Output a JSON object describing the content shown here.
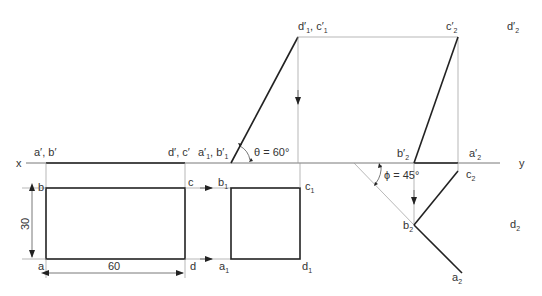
{
  "diagram": {
    "type": "orthographic-projection",
    "reference_line": {
      "left_label": "x",
      "right_label": "y"
    },
    "labels": {
      "top_left_elevation": "a′, b′",
      "top_right_elevation": "d′, c′",
      "first_aux_elevation_1": "a′",
      "first_aux_elevation_1_sub": "1",
      "first_aux_elevation_2": "b′",
      "first_aux_elevation_2_sub": "1",
      "theta": "θ = 60°",
      "d1c1_top_1": "d′",
      "d1c1_top_1_sub": "1",
      "d1c1_top_2": "c′",
      "d1c1_top_2_sub": "1",
      "c2_prime": "c′",
      "c2_prime_sub": "2",
      "d2_prime": "d′",
      "d2_prime_sub": "2",
      "b2_prime": "b′",
      "b2_prime_sub": "2",
      "a2_prime": "a′",
      "a2_prime_sub": "2",
      "phi": "ϕ = 45°",
      "b": "b",
      "c": "c",
      "a": "a",
      "d": "d",
      "b1": "b",
      "b1_sub": "1",
      "c1": "c",
      "c1_sub": "1",
      "a1": "a",
      "a1_sub": "1",
      "d1": "d",
      "d1_sub": "1",
      "c2": "c",
      "c2_sub": "2",
      "b2": "b",
      "b2_sub": "2",
      "d2": "d",
      "d2_sub": "2",
      "a2": "a",
      "a2_sub": "2"
    },
    "dimensions": {
      "height": "30",
      "width": "60"
    },
    "angles": {
      "theta_deg": 60,
      "phi_deg": 45
    }
  }
}
